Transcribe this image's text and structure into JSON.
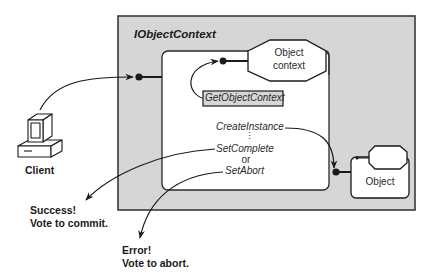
{
  "diagram": {
    "interface_title": "IObjectContext",
    "object_context_label_line1": "Object",
    "object_context_label_line2": "context",
    "get_object_context_label": "GetObjectContext",
    "create_instance_label": "CreateInstance",
    "ellipsis": "⋮",
    "set_complete_label": "SetComplete",
    "or_label": "or",
    "set_abort_label": "SetAbort",
    "object_label": "Object",
    "client_label": "Client",
    "success_line1": "Success!",
    "success_line2": "Vote to commit.",
    "error_line1": "Error!",
    "error_line2": "Vote to abort.",
    "colors": {
      "outer_box_fill": "#d6d6d6",
      "outer_box_stroke": "#3a3a3a",
      "inner_panel_fill": "#ffffff",
      "line": "#1a1a1a"
    }
  }
}
